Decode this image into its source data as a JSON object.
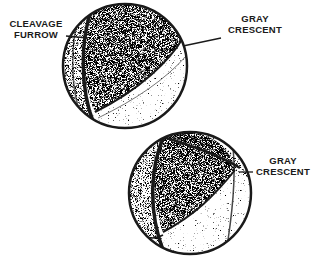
{
  "diagram": {
    "labels": {
      "cleavage_furrow_top": [
        "CLEAVAGE",
        "FURROW"
      ],
      "gray_crescent_top": [
        "GRAY",
        "CRESCENT"
      ],
      "gray_crescent_bottom": [
        "GRAY",
        "CRESCENT"
      ]
    },
    "colors": {
      "ink": "#1a1a1a",
      "background": "#ffffff"
    }
  }
}
